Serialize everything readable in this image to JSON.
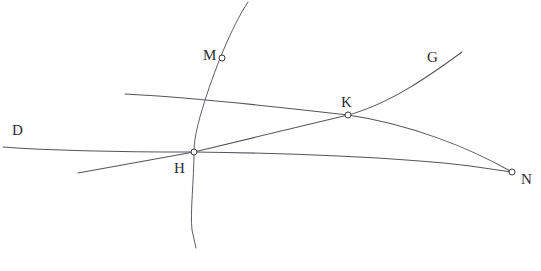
{
  "figure": {
    "type": "geometric-line-diagram",
    "width": 541,
    "height": 271,
    "background_color": "#ffffff",
    "stroke_color": "#54545c",
    "label_color": "#2b2b33",
    "marker_fill": "#ffffff",
    "marker_stroke": "#3a3a42"
  },
  "labels": {
    "d": "D",
    "m": "M",
    "g": "G",
    "k": "K",
    "h": "H",
    "n": "N"
  },
  "points": [
    {
      "id": "m",
      "label": "M",
      "x": 222,
      "y": 58,
      "label_x": 203,
      "label_y": 48,
      "marker": true
    },
    {
      "id": "k",
      "label": "K",
      "x": 348,
      "y": 115,
      "label_x": 341,
      "label_y": 95,
      "marker": true
    },
    {
      "id": "h",
      "label": "H",
      "x": 194,
      "y": 152,
      "label_x": 174,
      "label_y": 161,
      "marker": true
    },
    {
      "id": "n",
      "label": "N",
      "x": 512,
      "y": 172,
      "label_x": 521,
      "label_y": 172,
      "marker": true
    }
  ],
  "endpoint_labels": [
    {
      "id": "d",
      "label": "D",
      "label_x": 12,
      "label_y": 123
    },
    {
      "id": "g",
      "label": "G",
      "label_x": 427,
      "label_y": 50
    }
  ],
  "curves": [
    {
      "id": "curve-d-n",
      "name": "curve-D-to-N",
      "from_label": "D",
      "to_label": "N",
      "path": "M 3,147 C 70,152 140,152 194,152 C 280,153 400,157 470,166 L 512,172"
    },
    {
      "id": "curve-arc-k-n",
      "name": "arc-through-K-to-N",
      "from_label": "",
      "to_label": "N",
      "path": "M 125,94 C 190,97 270,106 348,115 C 410,124 470,148 512,172"
    },
    {
      "id": "curve-m-vertical",
      "name": "curve-through-M-and-H",
      "from_label": "M",
      "to_label": "",
      "path": "M 248,2 C 232,26 214,70 202,110 C 196,130 194,142 194,152 C 194,180 190,212 192,230 L 196,248"
    },
    {
      "id": "line-h-k-g",
      "name": "line-through-H-and-K-to-G",
      "from_label": "H",
      "to_label": "G",
      "path": "M 78,173 L 194,152 L 348,115 C 390,104 432,74 462,52"
    }
  ],
  "caption": {
    "text": ""
  }
}
